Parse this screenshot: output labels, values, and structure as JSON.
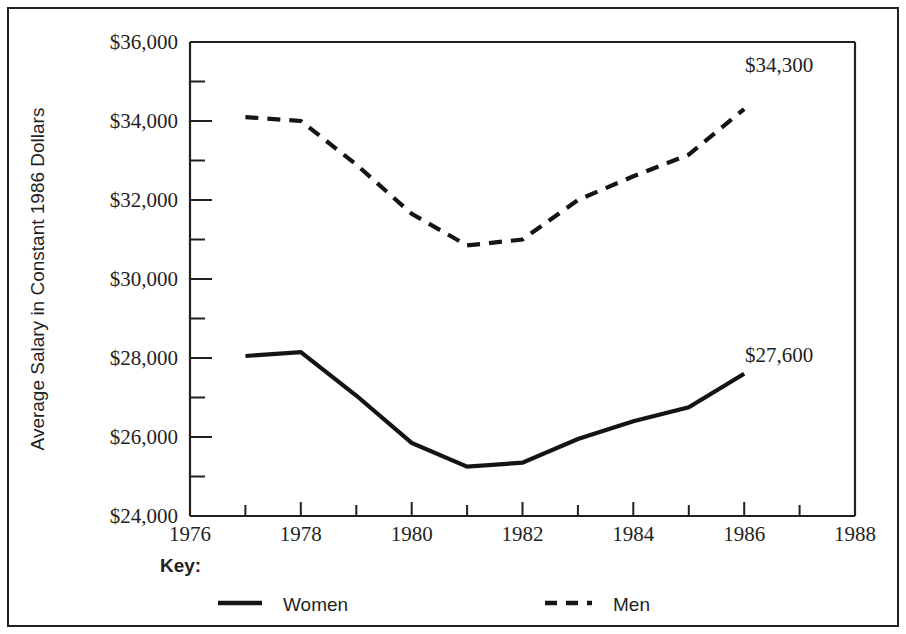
{
  "chart_data": {
    "type": "line",
    "title": "",
    "subtitle": "",
    "xlabel": "",
    "ylabel": "Average Salary in Constant 1986 Dollars",
    "xlim": [
      1976,
      1988
    ],
    "ylim": [
      24000,
      36000
    ],
    "grid": false,
    "legend_position": "below-plot",
    "x_ticks": [
      1976,
      1978,
      1980,
      1982,
      1984,
      1986,
      1988
    ],
    "x_tick_labels": [
      "1976",
      "1978",
      "1980",
      "1982",
      "1984",
      "1986",
      "1988"
    ],
    "x_minor_tick_interval": 1,
    "y_ticks": [
      24000,
      26000,
      28000,
      30000,
      32000,
      34000,
      36000
    ],
    "y_tick_labels": [
      "$24,000",
      "$26,000",
      "$28,000",
      "$30,000",
      "$32,000",
      "$34,000",
      "$36,000"
    ],
    "y_minor_tick_interval": 1000,
    "x": [
      1977,
      1978,
      1979,
      1980,
      1981,
      1982,
      1983,
      1984,
      1985,
      1986
    ],
    "series": [
      {
        "name": "Women",
        "style": "solid",
        "values": [
          28050,
          28150,
          27050,
          25850,
          25250,
          25350,
          25950,
          26400,
          26750,
          27600
        ]
      },
      {
        "name": "Men",
        "style": "dashed",
        "values": [
          34100,
          34000,
          32900,
          31650,
          30850,
          31000,
          32000,
          32600,
          33150,
          34300
        ]
      }
    ],
    "annotations": [
      {
        "text": "$34,300",
        "series": "Men",
        "x": 1986,
        "y": 34300
      },
      {
        "text": "$27,600",
        "series": "Women",
        "x": 1986,
        "y": 27600
      }
    ]
  },
  "legend": {
    "title": "Key:",
    "entries": [
      {
        "label": "Women",
        "style": "solid"
      },
      {
        "label": "Men",
        "style": "dashed"
      }
    ]
  }
}
